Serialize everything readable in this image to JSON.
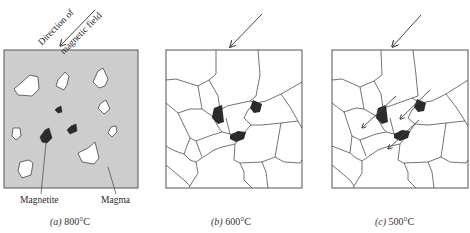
{
  "figure": {
    "panels": [
      {
        "id": "a",
        "caption_letter": "(a)",
        "caption_temp": "800°C",
        "state": "Magnetite crystals and other minerals suspended in liquid magma",
        "labels": {
          "field_line1": "Direction of",
          "field_line2": "magnetic field",
          "magnetite": "Magnetite",
          "magma": "Magma"
        }
      },
      {
        "id": "b",
        "caption_letter": "(b)",
        "caption_temp": "600°C",
        "state": "Magma solidified into interlocking grains with magnetite"
      },
      {
        "id": "c",
        "caption_letter": "(c)",
        "caption_temp": "500°C",
        "state": "Magnetite grains magnetized parallel to field direction (small arrows)"
      }
    ],
    "colors": {
      "magma_fill": "#cdcdcd",
      "crystal_fill": "#ffffff",
      "magnetite_fill": "#2b2b2b",
      "line": "#444444"
    }
  }
}
